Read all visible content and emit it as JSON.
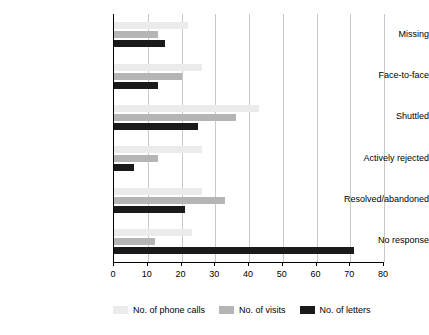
{
  "chart_data": {
    "type": "bar",
    "orientation": "horizontal",
    "title": "",
    "xlabel": "",
    "ylabel": "",
    "xlim": [
      0,
      80
    ],
    "xticks": [
      0,
      10,
      20,
      30,
      40,
      50,
      60,
      70,
      80
    ],
    "grid": true,
    "legend_position": "bottom",
    "categories": [
      "Missing",
      "Face-to-face",
      "Shuttled",
      "Actively rejected",
      "Resolved/abandoned",
      "No response"
    ],
    "series": [
      {
        "name": "No. of phone calls",
        "color": "#ebebeb",
        "values": [
          22,
          26,
          43,
          26,
          26,
          23
        ]
      },
      {
        "name": "No. of visits",
        "color": "#b5b5b5",
        "values": [
          13,
          20,
          36,
          13,
          33,
          12
        ]
      },
      {
        "name": "No. of letters",
        "color": "#1a1a1a",
        "values": [
          15,
          13,
          25,
          6,
          21,
          71
        ]
      }
    ]
  },
  "legend": {
    "items": [
      {
        "label": "No. of phone calls",
        "color": "#ebebeb"
      },
      {
        "label": "No. of visits",
        "color": "#b5b5b5"
      },
      {
        "label": "No. of letters",
        "color": "#1a1a1a"
      }
    ]
  }
}
